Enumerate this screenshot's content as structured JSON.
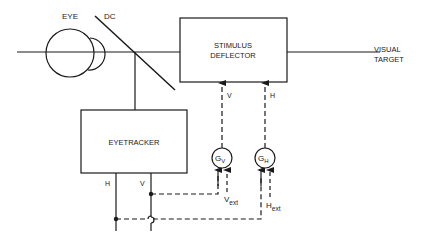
{
  "diagram": {
    "labels": {
      "eye": "EYE",
      "dc": "DC",
      "stimulus_line1": "STIMULUS",
      "stimulus_line2": "DEFLECTOR",
      "visual_line1": "VISUAL",
      "visual_line2": "TARGET",
      "eyetracker": "EYETRACKER",
      "tracker_h": "H",
      "tracker_v": "V",
      "defl_v": "V",
      "defl_h": "H",
      "gv_main": "G",
      "gv_sub": "V",
      "gh_main": "G",
      "gh_sub": "H",
      "vext_main": "V",
      "vext_sub": "ext",
      "hext_main": "H",
      "hext_sub": "ext"
    },
    "colors": {
      "line": "#1a1a1a",
      "background": "#ffffff"
    }
  }
}
